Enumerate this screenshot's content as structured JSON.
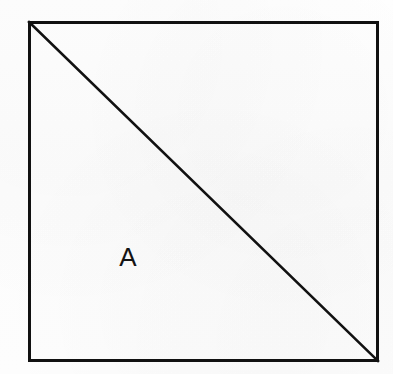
{
  "figure": {
    "kind": "geometry-diagram",
    "background_color": "#fdfdfd",
    "stroke_color": "#111111",
    "canvas": {
      "width": 393,
      "height": 374
    },
    "square": {
      "name": "outer-square",
      "x": 28,
      "y": 21,
      "width": 351,
      "height": 341,
      "stroke_width": 3,
      "fill": "none"
    },
    "diagonal": {
      "name": "diagonal-top-left-to-bottom-right",
      "x1": 29,
      "y1": 22,
      "x2": 378,
      "y2": 361,
      "stroke_width": 2.6
    },
    "labels": [
      {
        "id": "region-a",
        "text": "A",
        "x": 128,
        "y": 257,
        "font_size": 26,
        "color": "#141414",
        "region": "lower-left-triangle"
      }
    ]
  }
}
